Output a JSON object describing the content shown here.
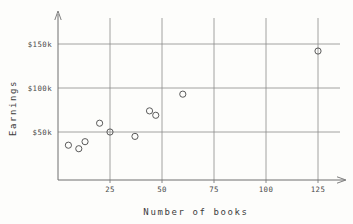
{
  "chart_data": {
    "type": "scatter",
    "title": "",
    "xlabel": "Number of books",
    "ylabel": "Earnings",
    "xlim": [
      0,
      133
    ],
    "ylim": [
      0,
      168000
    ],
    "grid": true,
    "legend": "none",
    "x_ticks": [
      {
        "value": 25,
        "label": "25"
      },
      {
        "value": 50,
        "label": "50"
      },
      {
        "value": 75,
        "label": "75"
      },
      {
        "value": 100,
        "label": "100"
      },
      {
        "value": 125,
        "label": "125"
      }
    ],
    "y_ticks": [
      {
        "value": 50000,
        "label": "$50k"
      },
      {
        "value": 100000,
        "label": "$100k"
      },
      {
        "value": 150000,
        "label": "$150k"
      }
    ],
    "points": [
      {
        "x": 5,
        "y": 35000
      },
      {
        "x": 10,
        "y": 31000
      },
      {
        "x": 13,
        "y": 39000
      },
      {
        "x": 20,
        "y": 60000
      },
      {
        "x": 25,
        "y": 50000
      },
      {
        "x": 37,
        "y": 45000
      },
      {
        "x": 44,
        "y": 74000
      },
      {
        "x": 47,
        "y": 69000
      },
      {
        "x": 60,
        "y": 93000
      },
      {
        "x": 125,
        "y": 142000
      }
    ],
    "marker": "open-circle",
    "marker_color": "#5a5a5a",
    "grid_color": "#8a8a8a",
    "axis_color": "#6f6f6f",
    "background_color": "#fdfdfb"
  }
}
